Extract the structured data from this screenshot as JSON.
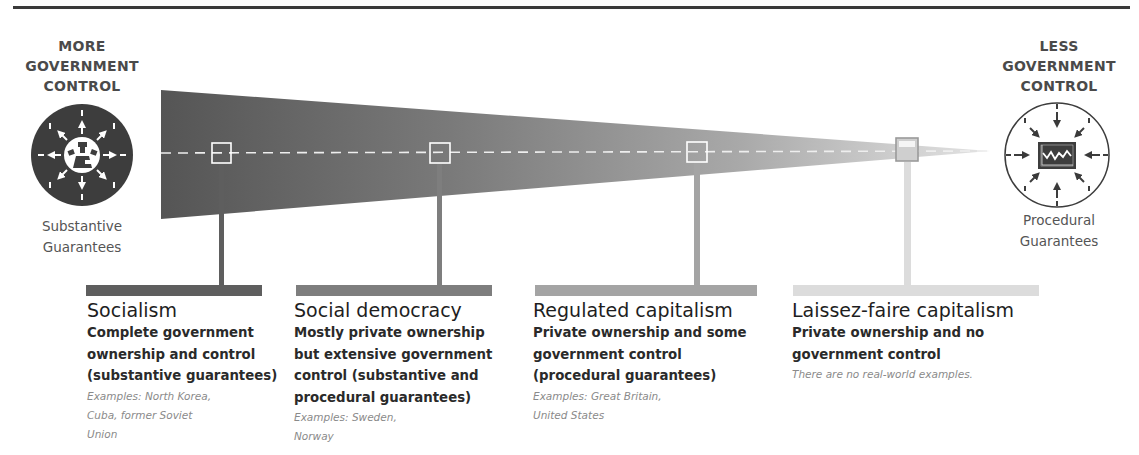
{
  "left_end": {
    "label_lines": [
      "MORE",
      "GOVERNMENT",
      "CONTROL"
    ],
    "guarantee_lines": [
      "Substantive",
      "Guarantees"
    ],
    "icon": "outward-arrows-circle-icon"
  },
  "right_end": {
    "label_lines": [
      "LESS",
      "GOVERNMENT",
      "CONTROL"
    ],
    "guarantee_lines": [
      "Procedural",
      "Guarantees"
    ],
    "icon": "inward-arrows-market-chart-circle-icon"
  },
  "colors": {
    "wedge_start": "#555555",
    "wedge_end": "#dedede",
    "rule": "#3a3a3a",
    "socialism": "#5e5e5e",
    "social_democracy": "#7e7e7e",
    "regulated_capitalism": "#a4a4a4",
    "laissez_faire": "#dcdcdc"
  },
  "systems": [
    {
      "title": "Socialism",
      "description_lines": [
        "Complete government",
        "ownership and control",
        "(substantive guarantees)"
      ],
      "example_lines": [
        "Examples: North Korea,",
        "Cuba, former Soviet",
        "Union"
      ]
    },
    {
      "title": "Social democracy",
      "description_lines": [
        "Mostly private ownership",
        "but extensive government",
        "control (substantive and",
        "procedural guarantees)"
      ],
      "example_lines": [
        "Examples: Sweden,",
        "Norway"
      ]
    },
    {
      "title": "Regulated capitalism",
      "description_lines": [
        "Private ownership and some",
        "government control",
        "(procedural guarantees)"
      ],
      "example_lines": [
        "Examples: Great Britain,",
        "United States"
      ]
    },
    {
      "title": "Laissez-faire capitalism",
      "description_lines": [
        "Private ownership and no",
        "government control"
      ],
      "example_lines": [
        "There are no real-world examples."
      ]
    }
  ]
}
